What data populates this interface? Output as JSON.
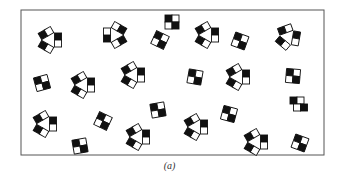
{
  "figure": {
    "caption": "(a)",
    "frame": {
      "x": 21,
      "y": 10,
      "width": 303,
      "height": 145,
      "stroke": "#555555"
    },
    "colors": {
      "black": "#111111",
      "white": "#ffffff",
      "stroke": "#111111"
    },
    "square_size": 7,
    "clusters": [
      {
        "type": "triangle",
        "x": 50,
        "y": 40,
        "rot": 0
      },
      {
        "type": "triangle",
        "x": 115,
        "y": 35,
        "rot": 180
      },
      {
        "type": "block",
        "x": 160,
        "y": 40,
        "rot": 25
      },
      {
        "type": "triangle",
        "x": 207,
        "y": 35,
        "rot": 0
      },
      {
        "type": "block",
        "x": 240,
        "y": 41,
        "rot": 20
      },
      {
        "type": "triangle",
        "x": 288,
        "y": 37,
        "rot": 10
      },
      {
        "type": "block",
        "x": 42,
        "y": 83,
        "rot": -15
      },
      {
        "type": "triangle",
        "x": 83,
        "y": 85,
        "rot": 0
      },
      {
        "type": "triangle",
        "x": 133,
        "y": 75,
        "rot": 0
      },
      {
        "type": "block",
        "x": 195,
        "y": 77,
        "rot": 10
      },
      {
        "type": "triangle",
        "x": 238,
        "y": 77,
        "rot": 0
      },
      {
        "type": "block",
        "x": 293,
        "y": 76,
        "rot": 5
      },
      {
        "type": "pair-v",
        "x": 297,
        "y": 104,
        "rot": 0
      },
      {
        "type": "triangle",
        "x": 45,
        "y": 124,
        "rot": 0
      },
      {
        "type": "block",
        "x": 103,
        "y": 121,
        "rot": 25
      },
      {
        "type": "block",
        "x": 158,
        "y": 110,
        "rot": -10
      },
      {
        "type": "block",
        "x": 80,
        "y": 146,
        "rot": -10
      },
      {
        "type": "triangle",
        "x": 138,
        "y": 137,
        "rot": 0
      },
      {
        "type": "triangle",
        "x": 196,
        "y": 127,
        "rot": 0
      },
      {
        "type": "block",
        "x": 229,
        "y": 114,
        "rot": 15
      },
      {
        "type": "triangle",
        "x": 256,
        "y": 142,
        "rot": 0
      },
      {
        "type": "block",
        "x": 300,
        "y": 143,
        "rot": 20
      },
      {
        "type": "block",
        "x": 172,
        "y": 22,
        "rot": 0
      }
    ]
  }
}
